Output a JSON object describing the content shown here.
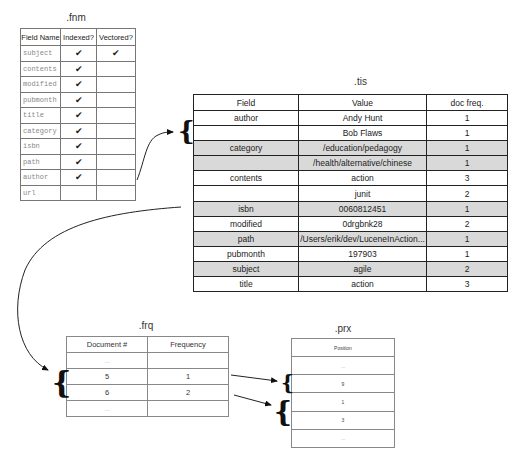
{
  "fnm": {
    "caption": ".fnm",
    "columns": [
      "Field Name",
      "Indexed?",
      "Vectored?"
    ],
    "check_glyph": "✔",
    "rows": [
      {
        "field": "subject",
        "indexed": "✔",
        "vectored": "✔"
      },
      {
        "field": "contents",
        "indexed": "✔",
        "vectored": ""
      },
      {
        "field": "modified",
        "indexed": "✔",
        "vectored": ""
      },
      {
        "field": "pubmonth",
        "indexed": "✔",
        "vectored": ""
      },
      {
        "field": "title",
        "indexed": "✔",
        "vectored": ""
      },
      {
        "field": "category",
        "indexed": "✔",
        "vectored": ""
      },
      {
        "field": "isbn",
        "indexed": "✔",
        "vectored": ""
      },
      {
        "field": "path",
        "indexed": "✔",
        "vectored": ""
      },
      {
        "field": "author",
        "indexed": "✔",
        "vectored": ""
      },
      {
        "field": "url",
        "indexed": "",
        "vectored": ""
      }
    ]
  },
  "tis": {
    "caption": ".tis",
    "columns": [
      "Field",
      "Value",
      "doc freq."
    ],
    "shade_color": "#d9d9d9",
    "rows": [
      {
        "field": "author",
        "value": "Andy Hunt",
        "doc_freq": "1",
        "shaded": false
      },
      {
        "field": "",
        "value": "Bob Flaws",
        "doc_freq": "1",
        "shaded": false
      },
      {
        "field": "category",
        "value": "/education/pedagogy",
        "doc_freq": "1",
        "shaded": true
      },
      {
        "field": "",
        "value": "/health/alternative/chinese",
        "doc_freq": "1",
        "shaded": true
      },
      {
        "field": "contents",
        "value": "action",
        "doc_freq": "3",
        "shaded": false
      },
      {
        "field": "",
        "value": "junit",
        "doc_freq": "2",
        "shaded": false
      },
      {
        "field": "isbn",
        "value": "0060812451",
        "doc_freq": "1",
        "shaded": true
      },
      {
        "field": "modified",
        "value": "0drgbnk28",
        "doc_freq": "2",
        "shaded": false
      },
      {
        "field": "path",
        "value": "/Users/erik/dev/LuceneInAction...",
        "doc_freq": "1",
        "shaded": true
      },
      {
        "field": "pubmonth",
        "value": "197903",
        "doc_freq": "1",
        "shaded": false
      },
      {
        "field": "subject",
        "value": "agile",
        "doc_freq": "2",
        "shaded": true
      },
      {
        "field": "title",
        "value": "action",
        "doc_freq": "3",
        "shaded": false
      }
    ]
  },
  "frq": {
    "caption": ".frq",
    "columns": [
      "Document #",
      "Frequency"
    ],
    "rows": [
      {
        "doc": "...",
        "freq": ""
      },
      {
        "doc": "5",
        "freq": "1"
      },
      {
        "doc": "6",
        "freq": "2"
      },
      {
        "doc": "...",
        "freq": ""
      }
    ]
  },
  "prx": {
    "caption": ".prx",
    "columns": [
      "Position"
    ],
    "rows": [
      "...",
      "9",
      "1",
      "3",
      "..."
    ]
  },
  "braces": {
    "glyph": "{"
  }
}
